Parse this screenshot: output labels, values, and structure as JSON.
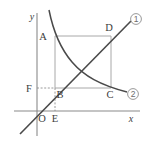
{
  "figure": {
    "background_color": "#ffffff",
    "axes": {
      "x_axis_label": "x",
      "y_axis_label": "y",
      "origin_label": "O",
      "axis_color": "#8a8a8a"
    },
    "points": [
      {
        "id": "A",
        "label": "A",
        "x": 55,
        "y": 36,
        "note": "upper-left vertex on hyperbola"
      },
      {
        "id": "B",
        "label": "B",
        "x": 55,
        "y": 88,
        "note": "lower-left vertex, on line"
      },
      {
        "id": "C",
        "label": "C",
        "x": 111,
        "y": 88,
        "note": "lower-right vertex on hyperbola"
      },
      {
        "id": "D",
        "label": "D",
        "x": 111,
        "y": 36,
        "note": "upper-right vertex on line"
      },
      {
        "id": "E",
        "label": "E",
        "x": 55,
        "y": 111,
        "note": "foot of perpendicular on x-axis"
      },
      {
        "id": "F",
        "label": "F",
        "x": 37,
        "y": 88,
        "note": "projection of B on y-axis"
      }
    ],
    "curves": [
      {
        "id": "line1",
        "tag": "①",
        "tag_text": "1",
        "kind": "line",
        "description": "straight line through origin with positive slope, passes through B and D",
        "color": "#4a4a4a"
      },
      {
        "id": "curve2",
        "tag": "②",
        "tag_text": "2",
        "kind": "hyperbola",
        "description": "inverse proportion curve in first quadrant passing through A and C",
        "color": "#4a4a4a"
      }
    ],
    "rectangle": {
      "name": "ABCD",
      "vertices": [
        "A",
        "D",
        "C",
        "B"
      ],
      "stroke_color": "#a8a8a8"
    },
    "guides": [
      {
        "id": "fb",
        "from": "F",
        "to": "B",
        "style": "dashed"
      },
      {
        "id": "be",
        "from": "B",
        "to": "E",
        "style": "dashed"
      }
    ]
  }
}
